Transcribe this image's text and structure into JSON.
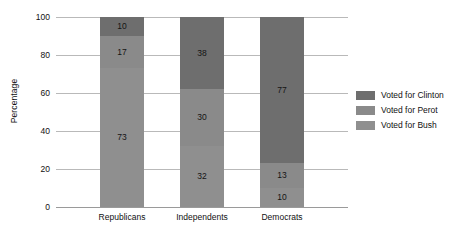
{
  "chart_data": {
    "type": "bar",
    "stacked": true,
    "title": "",
    "subtitle": "",
    "xlabel": "",
    "ylabel": "Percentage",
    "ylim": [
      0,
      100
    ],
    "yticks": [
      0,
      20,
      40,
      60,
      80,
      100
    ],
    "grid": true,
    "legend_position": "right",
    "categories": [
      "Republicans",
      "Independents",
      "Democrats"
    ],
    "series": [
      {
        "name": "Voted for Clinton",
        "color": "#6e6e6e",
        "values": [
          10,
          38,
          77
        ]
      },
      {
        "name": "Voted for Perot",
        "color": "#8a8a8a",
        "values": [
          17,
          30,
          13
        ]
      },
      {
        "name": "Voted for Bush",
        "color": "#8f8f8f",
        "values": [
          73,
          32,
          10
        ]
      }
    ],
    "stack_order_bottom_to_top": [
      "Voted for Bush",
      "Voted for Perot",
      "Voted for Clinton"
    ],
    "data_labels": {
      "Republicans": {
        "Voted for Clinton": 10,
        "Voted for Perot": 17,
        "Voted for Bush": 73
      },
      "Independents": {
        "Voted for Clinton": 38,
        "Voted for Perot": 30,
        "Voted for Bush": 32
      },
      "Democrats": {
        "Voted for Clinton": 77,
        "Voted for Perot": 13,
        "Voted for Bush": 10
      }
    }
  },
  "axes": {
    "y_title": "Percentage",
    "y_tick_labels": [
      "100",
      "80",
      "60",
      "40",
      "20",
      "0"
    ],
    "x_tick_labels": [
      "Republicans",
      "Independents",
      "Democrats"
    ]
  },
  "legend": {
    "items": [
      {
        "label": "Voted for Clinton",
        "color": "#6e6e6e"
      },
      {
        "label": "Voted for Perot",
        "color": "#8a8a8a"
      },
      {
        "label": "Voted for Bush",
        "color": "#8f8f8f"
      }
    ]
  },
  "colors": {
    "background": "#ffffff",
    "gridline": "#b9b9b9",
    "baseline": "#9a9a9a",
    "text": "#111111",
    "clinton": "#6e6e6e",
    "perot": "#8a8a8a",
    "bush": "#8f8f8f"
  }
}
